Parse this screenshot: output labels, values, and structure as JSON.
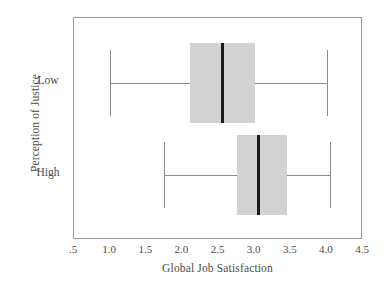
{
  "chart_data": {
    "type": "box",
    "title": "",
    "xlabel": "Global Job Satisfaction",
    "ylabel": "Perception of Justice",
    "orientation": "horizontal",
    "xlim": [
      0.5,
      4.5
    ],
    "xticks": [
      0.5,
      1.0,
      1.5,
      2.0,
      2.5,
      3.0,
      3.5,
      4.0,
      4.5
    ],
    "xtick_labels": [
      ".5",
      "1.0",
      "1.5",
      "2.0",
      "2.5",
      "3.0",
      "3.5",
      "4.0",
      "4.5"
    ],
    "categories": [
      "Low",
      "High"
    ],
    "grid": false,
    "legend": null,
    "box_fill_color": "#d2d2d2",
    "median_color": "#1b1b1b",
    "whisker_color": "#8c8c8c",
    "frame_color": "#9a9a9a",
    "boxes": [
      {
        "category": "Low",
        "whisker_low": 1.0,
        "q1": 2.1,
        "median": 2.55,
        "q3": 3.0,
        "whisker_high": 4.0
      },
      {
        "category": "High",
        "whisker_low": 1.75,
        "q1": 2.75,
        "median": 3.05,
        "q3": 3.45,
        "whisker_high": 4.05
      }
    ]
  },
  "axis": {
    "y_title": "Perception of Justice",
    "x_title": "Global Job Satisfaction",
    "y_labels": [
      "Low",
      "High"
    ],
    "x_labels": [
      ".5",
      "1.0",
      "1.5",
      "2.0",
      "2.5",
      "3.0",
      "3.5",
      "4.0",
      "4.5"
    ]
  }
}
